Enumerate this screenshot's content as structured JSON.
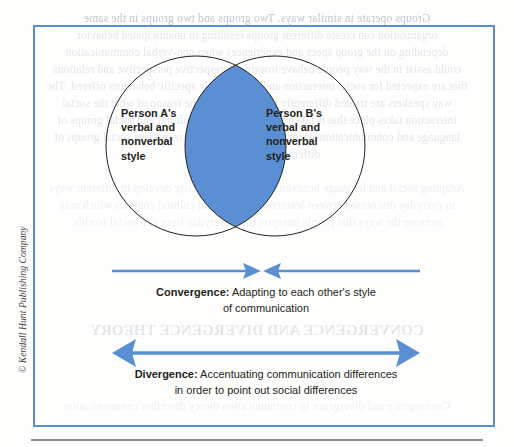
{
  "figure": {
    "accent_color": "#5b8fd4",
    "overlap_fill": "#5b8fd4",
    "circle_stroke": "#231f20",
    "text_color": "#231f20"
  },
  "venn": {
    "left_circle": {
      "name": "person-a-circle",
      "label": "Person A's\nverbal and\nnonverbal\nstyle"
    },
    "right_circle": {
      "name": "person-b-circle",
      "label": "Person B's\nverbal and\nnonverbal\nstyle"
    },
    "overlap": {
      "name": "overlap-lens",
      "label": ""
    }
  },
  "arrows": {
    "convergence": {
      "name": "convergence-arrows",
      "direction": "inward",
      "heads": 2
    },
    "divergence": {
      "name": "divergence-arrow",
      "direction": "outward",
      "heads": 2
    }
  },
  "captions": {
    "convergence": {
      "term": "Convergence:",
      "description": " Adapting to each other's style",
      "line2": "of communication"
    },
    "divergence": {
      "term": "Divergence:",
      "description": " Accentuating communication differences",
      "line2": "in order to point out social differences"
    }
  },
  "copyright": {
    "text": "© Kendall Hunt Publishing Company"
  },
  "background_bleed": [
    "Groups operate in similar ways. Two groups and two groups in the same",
    "organization can create different groups resulting in unanticipated behavior",
    "depending on the group specs and experiences when non-verbal communication",
    "could assist in the way people behave toward the respective perspective and relations",
    "that are expected for social interaction and all culturally specific behaviors offered. The",
    "way speakers are treated differently in context or by the reason of what the social",
    "interaction takes place that is taken into the context of cultural and social groups of",
    "language and communication systems of interpretation in respective social groups of",
    "difference (Tanaka, 1995).",
    "Adapting social and language behaviors has helped diversity develop in different ways",
    "in everyday discourse between learners and the social cultural contexts which may",
    "increase the ways that people interpret their everyday lives and social worlds.",
    "CONVERGENCE AND DIVERGENCE THEORY",
    "Convergence and divergence in communication theory describes communication",
    "where interactions in a dialog of mutual adjustment so it is important to know"
  ]
}
